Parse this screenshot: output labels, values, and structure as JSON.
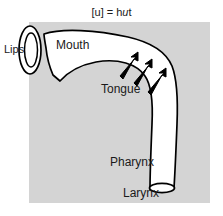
{
  "figure": {
    "title_prefix": "[u] = h",
    "title_italic": "u",
    "title_suffix": "t",
    "title_full": "[u] = hut",
    "type": "vocal-tract-sagittal-diagram",
    "background_color": "#ffffff",
    "shade_color": "#d4d4d4",
    "tract_fill": "#ffffff",
    "outline_color": "#000000",
    "text_color": "#1a1a1a"
  },
  "labels": {
    "lips": "Lips",
    "mouth": "Mouth",
    "tongue": "Tongue",
    "pharynx": "Pharynx",
    "larynx": "Larynx"
  },
  "arrows": {
    "count": 3,
    "direction": "up-right",
    "meaning": "tongue body raising/backing gesture"
  },
  "shade_block": {
    "x": 29,
    "y": 22,
    "width": 181,
    "height": 181
  }
}
